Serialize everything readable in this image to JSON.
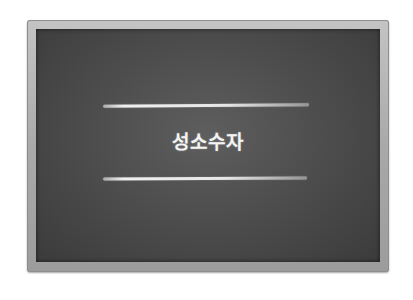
{
  "board": {
    "title": "성소수자",
    "colors": {
      "frame": "#a9a9a9",
      "board": "#4e4e4e",
      "chalk": "#efefef"
    }
  }
}
